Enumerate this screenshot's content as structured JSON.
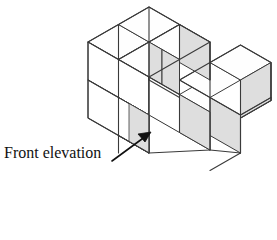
{
  "figure": {
    "caption": "Front elevation",
    "arrow": {
      "name": "front-elevation-arrow",
      "direction": "up-right",
      "from": [
        112,
        160
      ],
      "to": [
        150,
        133
      ]
    },
    "colors": {
      "outline": "#3a3a3a",
      "face_top": "#fefefe",
      "face_left": "#ffffff",
      "face_right": "#dedede",
      "text": "#111111",
      "background": "#ffffff"
    },
    "projection": {
      "type": "isometric",
      "cube_edge_px": 41,
      "x_axis_px": [
        30.5,
        17.5
      ],
      "y_axis_px": [
        30.5,
        -17.5
      ],
      "z_axis_px": [
        0,
        -38
      ],
      "origin_px": [
        88,
        128
      ]
    },
    "cubes": [
      {
        "id": "c1",
        "grid": [
          0,
          0,
          0
        ],
        "label": "left-column-lower"
      },
      {
        "id": "c2",
        "grid": [
          0,
          0,
          1
        ],
        "label": "left-column-upper"
      },
      {
        "id": "c3",
        "grid": [
          0,
          1,
          0
        ],
        "label": "left-back-lower"
      },
      {
        "id": "c4",
        "grid": [
          0,
          1,
          1
        ],
        "label": "left-back-upper"
      },
      {
        "id": "c5",
        "grid": [
          1,
          0,
          0
        ],
        "label": "middle-front-lower"
      },
      {
        "id": "c6",
        "grid": [
          1,
          1,
          0
        ],
        "label": "middle-back-lower"
      },
      {
        "id": "c7",
        "grid": [
          1,
          1,
          1
        ],
        "label": "middle-back-upper"
      },
      {
        "id": "c8",
        "grid": [
          2,
          0,
          0
        ],
        "label": "right-front-lower"
      },
      {
        "id": "c9",
        "grid": [
          2,
          1,
          0
        ],
        "label": "right-back-lower"
      }
    ],
    "faces": [
      {
        "name": "top-face-left-back",
        "kind": "top",
        "points": "88,42 118.5,24.5 149,42 118.5,59.5"
      },
      {
        "name": "top-face-left-front",
        "kind": "top",
        "points": "118.5,59.5 149,42 179.5,59.5 149,77"
      },
      {
        "name": "top-face-mid-back",
        "kind": "top",
        "points": "149,42 179.5,24.5 210,42 179.5,59.5"
      },
      {
        "name": "top-face-mid-front",
        "kind": "top",
        "points": "179.5,80 210,62.5 240.5,80 210,97.5"
      },
      {
        "name": "top-face-right",
        "kind": "top",
        "points": "210,62.5 240.5,45 271,62.5 240.5,80"
      },
      {
        "name": "top-face-step",
        "kind": "top",
        "points": "149,77 179.5,59.5 210,77 179.5,94.5"
      },
      {
        "name": "left-face-upper",
        "kind": "left",
        "points": "88,42 118.5,59.5 118.5,97.5 88,80"
      },
      {
        "name": "left-face-lower",
        "kind": "left",
        "points": "88,80 118.5,97.5 118.5,135.5 88,118"
      },
      {
        "name": "front-face-upper",
        "kind": "right",
        "points": "118.5,59.5 149,77 149,115 118.5,97.5"
      },
      {
        "name": "front-face-lower",
        "kind": "right",
        "points": "118.5,97.5 149,115 149,153 118.5,135.5"
      },
      {
        "name": "step-riser-face",
        "kind": "right",
        "points": "149,42 179.5,59.5 179.5,97.5 149,80"
      },
      {
        "name": "mid-front-face",
        "kind": "right",
        "points": "149,77 179.5,94.5 179.5,132.5 149,115"
      },
      {
        "name": "right-front-face-a",
        "kind": "right",
        "points": "179.5,94.5 210,112 210,150 179.5,132.5"
      },
      {
        "name": "right-front-face-b",
        "kind": "right",
        "points": "210,97.5 240.5,115 240.5,153 210,135.5"
      },
      {
        "name": "right-side-face",
        "kind": "right",
        "points": "240.5,80 271,62.5 271,100.5 240.5,118"
      }
    ]
  }
}
